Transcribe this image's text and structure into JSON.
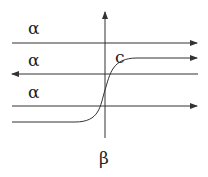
{
  "diagram": {
    "labels": {
      "alpha_top": "α",
      "alpha_middle": "α",
      "alpha_bottom": "α",
      "curve_label": "c",
      "beta_bottom": "β"
    },
    "lines": [
      {
        "name": "top-line",
        "direction": "right",
        "y": 43
      },
      {
        "name": "middle-line",
        "direction": "left",
        "y": 74
      },
      {
        "name": "bottom-line",
        "direction": "right",
        "y": 106
      }
    ],
    "vertical_axis": {
      "direction": "up",
      "x": 105
    },
    "curve": {
      "name": "c",
      "shape": "sigmoid",
      "direction": "right"
    },
    "stroke_color": "#333333"
  }
}
